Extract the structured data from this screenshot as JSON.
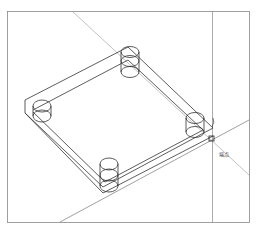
{
  "drawing": {
    "view": "isometric wireframe",
    "snap_tooltip": "端点",
    "line_color": "#333333",
    "frame_color": "#777777"
  }
}
